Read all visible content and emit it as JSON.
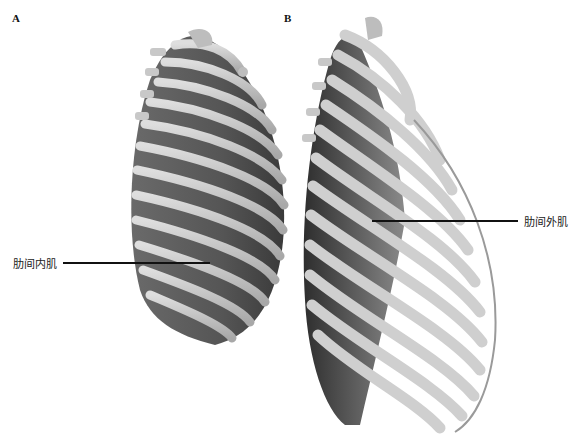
{
  "figure": {
    "panels": [
      {
        "letter": "A",
        "label": "肋间内肌",
        "description": "rib cage showing internal intercostal muscles"
      },
      {
        "letter": "B",
        "label": "肋间外肌",
        "description": "rib cage showing external intercostal muscles"
      }
    ],
    "colors": {
      "background": "#ffffff",
      "rib": "#b9b9b9",
      "rib_highlight": "#dcdcdc",
      "muscle_dark": "#4a4a4a",
      "leader_line": "#111111"
    }
  }
}
